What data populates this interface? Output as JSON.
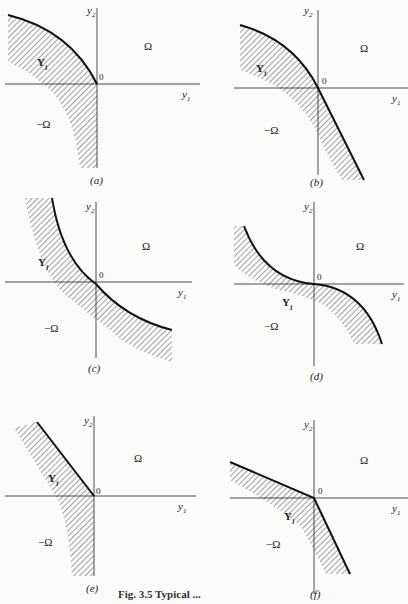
{
  "figure": {
    "caption": "Fig. 3.5 Typical ...",
    "axis_labels": {
      "x": "y",
      "x_sub": "1",
      "y": "y",
      "y_sub": "2"
    },
    "origin_label": "0",
    "region_labels": {
      "omega": "Ω",
      "neg_omega": "−Ω",
      "set": "Y",
      "set_sub": "j"
    },
    "panels": [
      {
        "id": "a",
        "label": "(a)",
        "description": "Concave boundary in 2nd quadrant; set extends down negative y2 axis"
      },
      {
        "id": "b",
        "label": "(b)",
        "description": "Concave boundary through origin into 4th quadrant"
      },
      {
        "id": "c",
        "label": "(c)",
        "description": "Convex boundary through origin into 4th quadrant"
      },
      {
        "id": "d",
        "label": "(d)",
        "description": "S-shaped boundary, flat at origin"
      },
      {
        "id": "e",
        "label": "(e)",
        "description": "Linear ray in 2nd quadrant; set extends down negative y2 axis"
      },
      {
        "id": "f",
        "label": "(f)",
        "description": "Two linear rays meeting at origin (kinked)"
      }
    ]
  }
}
